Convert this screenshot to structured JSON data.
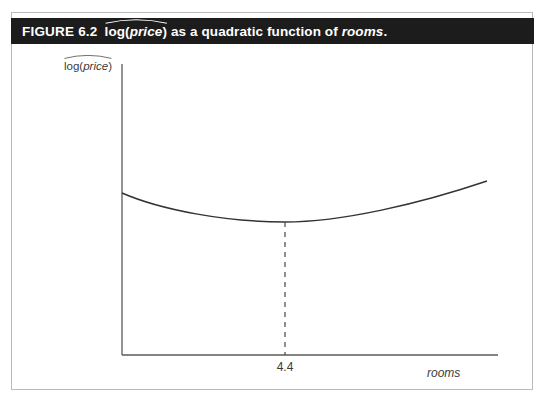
{
  "figure": {
    "number_label": "FIGURE 6.2",
    "caption_hatted_expr": "log(price)",
    "caption_rest_before_italic": " as a quadratic function of ",
    "caption_italic_term": "rooms",
    "caption_terminator": ".",
    "bar_color": "#1c1c1c",
    "bar_text_color": "#ffffff",
    "frame_color": "#b9b9b9",
    "ink_color": "#3a3a3a"
  },
  "chart_data": {
    "type": "line",
    "title": "log(price) as a quadratic function of rooms",
    "xlabel": "rooms",
    "ylabel": "log(price)",
    "ylabel_hat": true,
    "grid": false,
    "legend": null,
    "annotations": [
      {
        "name": "minimum-guideline",
        "label": "4.4",
        "x": 4.4,
        "style": "dashed-vertical",
        "from": "curve-minimum",
        "to": "x-axis"
      }
    ],
    "axis_ticks": {
      "x": [
        "4.4"
      ],
      "y": []
    },
    "series": [
      {
        "name": "quadratic fit",
        "shape": "upward-parabola",
        "minimum_x": 4.4,
        "points": [
          {
            "x": 0.0,
            "y": 0.78
          },
          {
            "x": 0.1,
            "y": 0.71
          },
          {
            "x": 0.2,
            "y": 0.65
          },
          {
            "x": 0.3,
            "y": 0.59
          },
          {
            "x": 0.4,
            "y": 0.54
          },
          {
            "x": 0.45,
            "y": 0.51
          },
          {
            "x": 0.5,
            "y": 0.5
          },
          {
            "x": 0.55,
            "y": 0.5
          },
          {
            "x": 0.6,
            "y": 0.51
          },
          {
            "x": 0.65,
            "y": 0.54
          },
          {
            "x": 0.7,
            "y": 0.58
          },
          {
            "x": 0.8,
            "y": 0.7
          },
          {
            "x": 0.9,
            "y": 0.85
          },
          {
            "x": 1.0,
            "y": 1.0
          }
        ]
      }
    ],
    "xlim": [
      0,
      1
    ],
    "ylim": [
      0,
      1
    ]
  }
}
